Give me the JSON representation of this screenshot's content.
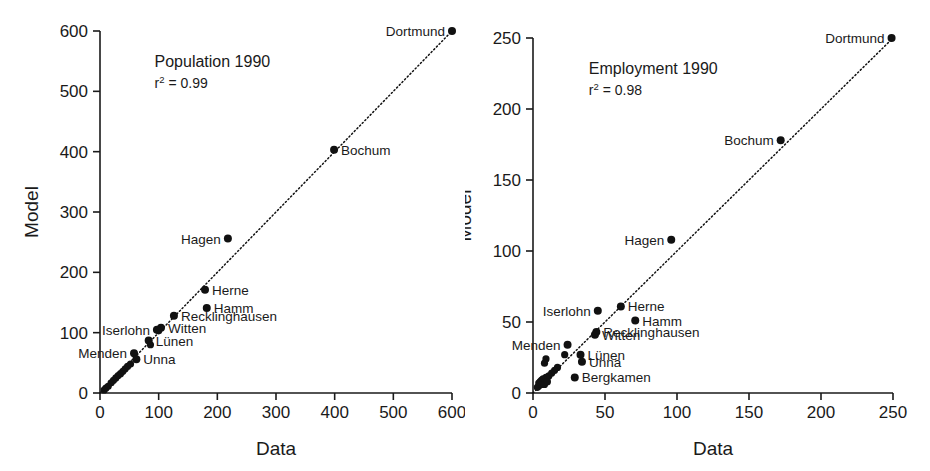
{
  "figure": {
    "panel_count": 2,
    "background": "#ffffff",
    "ink": "#111111"
  },
  "chart_data": [
    {
      "type": "scatter",
      "panel": "left",
      "title": "Population 1990",
      "r_squared_label": "r",
      "r_squared_exponent": "2",
      "r_squared_value": " = 0.99",
      "r_squared": 0.99,
      "xlabel": "Data",
      "ylabel": "Model",
      "xlim": [
        0,
        600
      ],
      "ylim": [
        0,
        600
      ],
      "xticks": [
        0,
        100,
        200,
        300,
        400,
        500,
        600
      ],
      "yticks": [
        0,
        100,
        200,
        300,
        400,
        500,
        600
      ],
      "grid": false,
      "legend": "none",
      "fit_line": {
        "style": "dotted",
        "from": [
          0,
          0
        ],
        "to": [
          600,
          600
        ],
        "note": "1:1 reference / regression line"
      },
      "points": [
        {
          "label": "Dortmund",
          "x": 600,
          "y": 600,
          "label_pos": "left"
        },
        {
          "label": "Bochum",
          "x": 399,
          "y": 403,
          "label_pos": "right"
        },
        {
          "label": "Hagen",
          "x": 218,
          "y": 256,
          "label_pos": "left"
        },
        {
          "label": "Herne",
          "x": 179,
          "y": 171,
          "label_pos": "right"
        },
        {
          "label": "Hamm",
          "x": 182,
          "y": 141,
          "label_pos": "right"
        },
        {
          "label": "Recklinghausen",
          "x": 126,
          "y": 128,
          "label_pos": "right"
        },
        {
          "label": "Witten",
          "x": 104,
          "y": 108,
          "label_pos": "right"
        },
        {
          "label": "Iserlohn",
          "x": 97,
          "y": 105,
          "label_pos": "left"
        },
        {
          "label": "Lünen",
          "x": 83,
          "y": 87,
          "label_pos": "right"
        },
        {
          "label": "Menden",
          "x": 58,
          "y": 66,
          "label_pos": "left"
        },
        {
          "label": "Unna",
          "x": 62,
          "y": 56,
          "label_pos": "right"
        },
        {
          "label": "",
          "x": 86,
          "y": 80,
          "label_pos": "none"
        },
        {
          "label": "",
          "x": 100,
          "y": 103,
          "label_pos": "none"
        },
        {
          "label": "",
          "x": 52,
          "y": 48,
          "label_pos": "none"
        },
        {
          "label": "",
          "x": 47,
          "y": 44,
          "label_pos": "none"
        },
        {
          "label": "",
          "x": 43,
          "y": 40,
          "label_pos": "none"
        },
        {
          "label": "",
          "x": 39,
          "y": 36,
          "label_pos": "none"
        },
        {
          "label": "",
          "x": 35,
          "y": 32,
          "label_pos": "none"
        },
        {
          "label": "",
          "x": 31,
          "y": 29,
          "label_pos": "none"
        },
        {
          "label": "",
          "x": 27,
          "y": 25,
          "label_pos": "none"
        },
        {
          "label": "",
          "x": 23,
          "y": 21,
          "label_pos": "none"
        },
        {
          "label": "",
          "x": 19,
          "y": 17,
          "label_pos": "none"
        },
        {
          "label": "",
          "x": 14,
          "y": 11,
          "label_pos": "none"
        },
        {
          "label": "",
          "x": 10,
          "y": 8,
          "label_pos": "none"
        },
        {
          "label": "",
          "x": 7,
          "y": 5,
          "label_pos": "none"
        }
      ]
    },
    {
      "type": "scatter",
      "panel": "right",
      "title": "Employment 1990",
      "r_squared_label": "r",
      "r_squared_exponent": "2",
      "r_squared_value": " = 0.98",
      "r_squared": 0.98,
      "xlabel": "Data",
      "ylabel": "Model",
      "xlim": [
        0,
        250
      ],
      "ylim": [
        0,
        250
      ],
      "xticks": [
        0,
        50,
        100,
        150,
        200,
        250
      ],
      "yticks": [
        0,
        50,
        100,
        150,
        200,
        250
      ],
      "grid": false,
      "legend": "none",
      "fit_line": {
        "style": "dotted",
        "from": [
          0,
          0
        ],
        "to": [
          250,
          250
        ],
        "note": "1:1 reference / regression line"
      },
      "points": [
        {
          "label": "Dortmund",
          "x": 249,
          "y": 250,
          "label_pos": "left"
        },
        {
          "label": "Bochum",
          "x": 172,
          "y": 178,
          "label_pos": "left"
        },
        {
          "label": "Hagen",
          "x": 96,
          "y": 108,
          "label_pos": "left"
        },
        {
          "label": "Herne",
          "x": 61,
          "y": 61,
          "label_pos": "right"
        },
        {
          "label": "Iserlohn",
          "x": 45,
          "y": 58,
          "label_pos": "left"
        },
        {
          "label": "Hamm",
          "x": 71,
          "y": 51,
          "label_pos": "right"
        },
        {
          "label": "Recklinghausen",
          "x": 44,
          "y": 43,
          "label_pos": "right"
        },
        {
          "label": "Witten",
          "x": 43,
          "y": 41,
          "label_pos": "right"
        },
        {
          "label": "Menden",
          "x": 24,
          "y": 34,
          "label_pos": "left"
        },
        {
          "label": "Lünen",
          "x": 33,
          "y": 27,
          "label_pos": "right"
        },
        {
          "label": "Unna",
          "x": 34,
          "y": 22,
          "label_pos": "right"
        },
        {
          "label": "Bergkamen",
          "x": 29,
          "y": 11,
          "label_pos": "right"
        },
        {
          "label": "",
          "x": 22,
          "y": 27,
          "label_pos": "none"
        },
        {
          "label": "",
          "x": 9,
          "y": 24,
          "label_pos": "none"
        },
        {
          "label": "",
          "x": 8,
          "y": 21,
          "label_pos": "none"
        },
        {
          "label": "",
          "x": 17,
          "y": 18,
          "label_pos": "none"
        },
        {
          "label": "",
          "x": 15,
          "y": 16,
          "label_pos": "none"
        },
        {
          "label": "",
          "x": 13,
          "y": 14,
          "label_pos": "none"
        },
        {
          "label": "",
          "x": 11,
          "y": 12,
          "label_pos": "none"
        },
        {
          "label": "",
          "x": 9,
          "y": 11,
          "label_pos": "none"
        },
        {
          "label": "",
          "x": 7,
          "y": 10,
          "label_pos": "none"
        },
        {
          "label": "",
          "x": 6,
          "y": 9,
          "label_pos": "none"
        },
        {
          "label": "",
          "x": 5,
          "y": 8,
          "label_pos": "none"
        },
        {
          "label": "",
          "x": 4,
          "y": 7,
          "label_pos": "none"
        },
        {
          "label": "",
          "x": 4,
          "y": 5,
          "label_pos": "none"
        },
        {
          "label": "",
          "x": 3,
          "y": 4,
          "label_pos": "none"
        },
        {
          "label": "",
          "x": 6,
          "y": 6,
          "label_pos": "none"
        },
        {
          "label": "",
          "x": 8,
          "y": 6,
          "label_pos": "none"
        },
        {
          "label": "",
          "x": 10,
          "y": 8,
          "label_pos": "none"
        }
      ]
    }
  ]
}
